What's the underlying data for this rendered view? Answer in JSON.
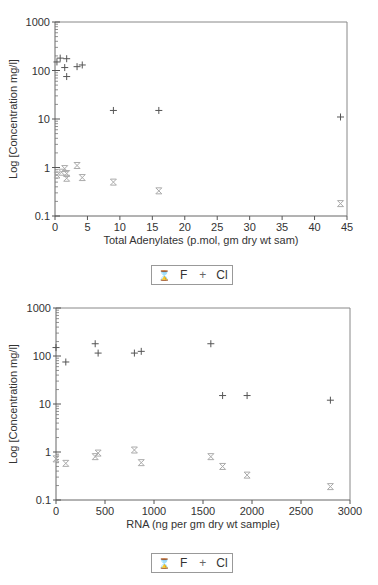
{
  "chart_data": [
    {
      "type": "scatter",
      "title": "",
      "xlabel": "Total Adenylates (p.mol, gm dry wt sam)",
      "ylabel": "Log  [Concentration mg/l]",
      "yscale": "log",
      "xlim": [
        0,
        45
      ],
      "ylim": [
        0.1,
        1000
      ],
      "xticks": [
        0,
        5,
        10,
        15,
        20,
        25,
        30,
        35,
        40,
        45
      ],
      "yticks": [
        "0.1",
        "1",
        "10",
        "100",
        "1000"
      ],
      "grid": false,
      "legend_position": "bottom-center",
      "series": [
        {
          "name": "F",
          "marker": "hourglass",
          "color": "#aaaaaa",
          "x": [
            0.3,
            1.0,
            1.5,
            1.8,
            1.8,
            3.4,
            4.2,
            9,
            16,
            44
          ],
          "y": [
            0.7,
            0.8,
            0.95,
            0.75,
            0.6,
            1.1,
            0.62,
            0.5,
            0.33,
            0.18
          ]
        },
        {
          "name": "Cl",
          "marker": "plus",
          "color": "#555555",
          "x": [
            0.3,
            0.8,
            1.5,
            1.8,
            1.8,
            3.4,
            4.2,
            9,
            16,
            44
          ],
          "y": [
            150,
            180,
            115,
            175,
            75,
            120,
            130,
            15,
            15,
            11
          ]
        }
      ]
    },
    {
      "type": "scatter",
      "title": "",
      "xlabel": "RNA (ng per gm dry wt sample)",
      "ylabel": "Log  [Concentration mg/l]",
      "yscale": "log",
      "xlim": [
        0,
        3000
      ],
      "ylim": [
        0.1,
        1000
      ],
      "xticks": [
        0,
        500,
        1000,
        1500,
        2000,
        2500,
        3000
      ],
      "yticks": [
        "0.1",
        "1",
        "10",
        "100",
        "1000"
      ],
      "grid": false,
      "legend_position": "bottom-center",
      "series": [
        {
          "name": "F",
          "marker": "hourglass",
          "color": "#aaaaaa",
          "x": [
            0,
            100,
            400,
            430,
            800,
            870,
            1580,
            1700,
            1950,
            2800
          ],
          "y": [
            0.72,
            0.58,
            0.8,
            0.95,
            1.1,
            0.6,
            0.8,
            0.5,
            0.33,
            0.19
          ]
        },
        {
          "name": "Cl",
          "marker": "plus",
          "color": "#555555",
          "x": [
            0,
            100,
            400,
            430,
            800,
            870,
            1580,
            1700,
            1950,
            2800
          ],
          "y": [
            150,
            75,
            180,
            115,
            115,
            125,
            180,
            15,
            15,
            12
          ]
        }
      ]
    }
  ],
  "legends": [
    {
      "items": [
        {
          "label": "F",
          "marker": "⌛"
        },
        {
          "label": "Cl",
          "marker": "+"
        }
      ]
    },
    {
      "items": [
        {
          "label": "F",
          "marker": "⌛"
        },
        {
          "label": "Cl",
          "marker": "+"
        }
      ]
    }
  ]
}
